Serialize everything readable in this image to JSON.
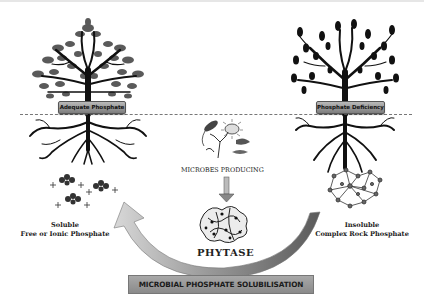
{
  "diagram": {
    "title": "MICROBIAL PHOSPHATE SOLUBILISATION",
    "left_tree": {
      "label": "Adequate Phosphate",
      "caption_line1": "Soluble",
      "caption_line2": "Free or Ionic Phosphate"
    },
    "right_tree": {
      "label": "Phosphate Deficiency",
      "caption_line1": "Insoluble",
      "caption_line2": "Complex Rock Phosphate"
    },
    "center": {
      "microbes_label": "MICROBES PRODUCING",
      "enzyme_label": "PHYTASE"
    },
    "colors": {
      "tree": "#1a1a1a",
      "leaves_left": "#555555",
      "arrow_light": "#d0d0d0",
      "arrow_dark": "#6a6a6a",
      "banner": "#9a9a9a"
    }
  }
}
